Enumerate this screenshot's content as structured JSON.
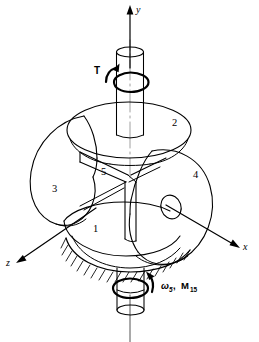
{
  "figure": {
    "kind": "bevel-gear-differential-schematic",
    "background_color": "#ffffff",
    "line_color": "#000000",
    "axes": {
      "y_label": "y",
      "x_label": "x",
      "z_label": "z"
    },
    "torque": {
      "label": "T",
      "description": "input torque on upper shaft"
    },
    "output": {
      "omega_symbol": "ω",
      "omega_subscript": "5",
      "separator": ", ",
      "moment_symbol": "M",
      "moment_subscript": "15"
    },
    "members": [
      {
        "id": "1",
        "label": "1",
        "role": "lower-bevel-gear"
      },
      {
        "id": "2",
        "label": "2",
        "role": "upper-bevel-gear"
      },
      {
        "id": "3",
        "label": "3",
        "role": "left-planet-bevel-gear"
      },
      {
        "id": "4",
        "label": "4",
        "role": "right-planet-bevel-gear"
      },
      {
        "id": "5",
        "label": "5",
        "role": "carrier-spider"
      }
    ],
    "ground": {
      "style": "hatched-fixed-support"
    }
  }
}
